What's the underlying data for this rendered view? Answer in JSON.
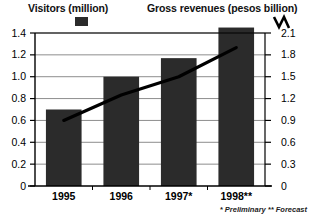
{
  "legend": {
    "visitors_label": "Visitors (million)",
    "revenue_label": "Gross revenues (pesos billion)",
    "visitors_marker": "filled-square-swatch",
    "revenue_marker": "zigzag-line-mark"
  },
  "footnote": "* Preliminary   ** Forecast",
  "chart_data": {
    "type": "bar",
    "title": "",
    "categories": [
      "1995",
      "1996",
      "1997*",
      "1998**"
    ],
    "series": [
      {
        "name": "Visitors (million)",
        "type": "bar",
        "axis": "left",
        "values": [
          0.7,
          1.0,
          1.17,
          1.45
        ],
        "color": "#2b2b2b"
      },
      {
        "name": "Gross revenues (pesos billion)",
        "type": "line",
        "axis": "right",
        "values": [
          0.9,
          1.25,
          1.5,
          1.9
        ],
        "color": "#000000"
      }
    ],
    "left_axis": {
      "label": "Visitors (million)",
      "ticks": [
        "0",
        "0.2",
        "0.4",
        "0.6",
        "0.8",
        "1.0",
        "1.2",
        "1.4"
      ],
      "tick_values": [
        0,
        0.2,
        0.4,
        0.6,
        0.8,
        1.0,
        1.2,
        1.4
      ],
      "ylim": [
        0,
        1.4
      ]
    },
    "right_axis": {
      "label": "Gross revenues (pesos billion)",
      "ticks": [
        "0",
        "0.3",
        "0.6",
        "0.9",
        "1.2",
        "1.5",
        "1.8",
        "2.1"
      ],
      "tick_values": [
        0,
        0.3,
        0.6,
        0.9,
        1.2,
        1.5,
        1.8,
        2.1
      ],
      "ylim": [
        0,
        2.1
      ]
    },
    "xlabel": "",
    "grid": true,
    "legend_position": "top"
  }
}
